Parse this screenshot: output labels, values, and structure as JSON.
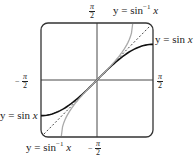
{
  "diagram": {
    "axis_labels": {
      "top": {
        "sign": "",
        "num": "π",
        "den": "2"
      },
      "bottom": {
        "sign": "−",
        "num": "π",
        "den": "2"
      },
      "left": {
        "sign": "−",
        "num": "π",
        "den": "2"
      },
      "right": {
        "sign": "",
        "num": "π",
        "den": "2"
      }
    },
    "curve_labels": {
      "arcsin_top": {
        "prefix": "y = sin",
        "sup": "−1",
        "var": "x"
      },
      "sin_right": {
        "prefix": "y = sin ",
        "var": "x"
      },
      "sin_left": {
        "prefix": "y = sin ",
        "var": "x"
      },
      "arcsin_bottom": {
        "prefix": "y = sin",
        "sup": "−1",
        "var": "x"
      }
    },
    "colors": {
      "frame": "#333333",
      "axes": "#333333",
      "sin_curve": "#111111",
      "arcsin_curve": "#aaaaaa",
      "identity_line": "#333333"
    }
  }
}
